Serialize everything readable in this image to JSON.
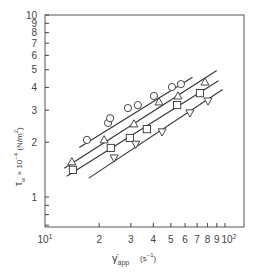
{
  "chart_data": {
    "type": "scatter",
    "title": "",
    "xlabel": "γ̇app (s⁻¹)",
    "ylabel": "τw × 10⁻⁴ (N/m²)",
    "xscale": "log",
    "yscale": "log",
    "xlim": [
      10,
      110
    ],
    "ylim": [
      0.69,
      10
    ],
    "grid": false,
    "legend": null,
    "x_ticks": [
      {
        "value": 10,
        "label": "10¹"
      },
      {
        "value": 20,
        "label": "2"
      },
      {
        "value": 30,
        "label": "3"
      },
      {
        "value": 40,
        "label": "4"
      },
      {
        "value": 50,
        "label": "5"
      },
      {
        "value": 60,
        "label": "6"
      },
      {
        "value": 70,
        "label": "7"
      },
      {
        "value": 80,
        "label": "8"
      },
      {
        "value": 90,
        "label": "9"
      },
      {
        "value": 100,
        "label": "10²"
      }
    ],
    "y_ticks": [
      {
        "value": 1,
        "label": "1"
      },
      {
        "value": 2,
        "label": "2"
      },
      {
        "value": 3,
        "label": "3"
      },
      {
        "value": 4,
        "label": "4"
      },
      {
        "value": 5,
        "label": "5"
      },
      {
        "value": 6,
        "label": "6"
      },
      {
        "value": 7,
        "label": "7"
      },
      {
        "value": 8,
        "label": "8"
      },
      {
        "value": 9,
        "label": "9"
      },
      {
        "value": 10,
        "label": "10"
      }
    ],
    "y_minor_ticks": [
      0.7,
      0.8,
      0.9
    ],
    "series": [
      {
        "name": "circles",
        "marker": "circle",
        "x": [
          17.1,
          22.4,
          23.0,
          28.9,
          32.8,
          40.3,
          50.7,
          56.9
        ],
        "y": [
          2.06,
          2.55,
          2.71,
          3.08,
          3.2,
          3.59,
          4.02,
          4.17
        ],
        "fit_line": {
          "x": [
            15.5,
            66
          ],
          "y": [
            1.87,
            4.55
          ]
        }
      },
      {
        "name": "triangles-up",
        "marker": "triangle-up",
        "x": [
          14.1,
          21.3,
          31.2,
          43.0,
          54.8,
          77.4
        ],
        "y": [
          1.56,
          2.06,
          2.52,
          3.33,
          3.59,
          4.28
        ],
        "fit_line": {
          "x": [
            12.8,
            90
          ],
          "y": [
            1.44,
            4.95
          ]
        }
      },
      {
        "name": "squares",
        "marker": "square",
        "x": [
          14.3,
          23.2,
          29.6,
          36.8,
          54.2,
          72.6
        ],
        "y": [
          1.41,
          1.86,
          2.11,
          2.36,
          3.2,
          3.72
        ],
        "fit_line": {
          "x": [
            13.2,
            92
          ],
          "y": [
            1.3,
            4.35
          ]
        }
      },
      {
        "name": "triangles-down",
        "marker": "triangle-down",
        "x": [
          24.2,
          31.9,
          44.7,
          63.8,
          80.5
        ],
        "y": [
          1.64,
          1.95,
          2.28,
          2.9,
          3.37
        ],
        "fit_line": {
          "x": [
            17.5,
            97
          ],
          "y": [
            1.27,
            3.9
          ]
        }
      }
    ]
  },
  "axes": {
    "x_label_main": "γ̇",
    "x_label_sub": "app",
    "x_label_unit": "(s",
    "x_label_unit_sup": "−1",
    "x_label_unit_end": ")",
    "y_label_main": "τ",
    "y_label_sub": "w",
    "y_label_mid": " × 10",
    "y_label_sup": "−4",
    "y_label_unit": " (N/m",
    "y_label_unit_sup": "2",
    "y_label_unit_end": ")"
  }
}
